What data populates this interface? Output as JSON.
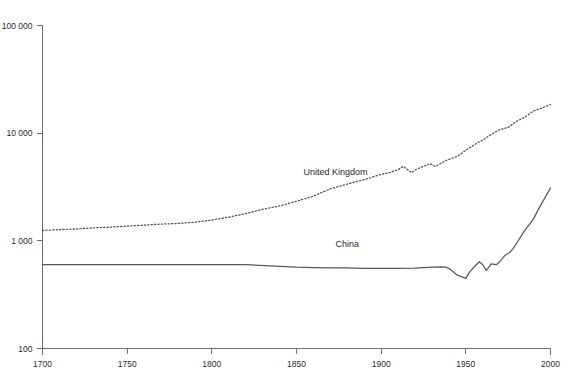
{
  "chart_data": {
    "type": "line",
    "title": "",
    "subtitle": "",
    "xlabel": "",
    "ylabel": "",
    "yscale": "log",
    "xlim": [
      1700,
      2000
    ],
    "ylim": [
      100,
      100000
    ],
    "grid": false,
    "legend_position": "inline-labels",
    "x_ticks": [
      1700,
      1750,
      1800,
      1850,
      1900,
      1950,
      2000
    ],
    "x_tick_labels": [
      "1700",
      "1750",
      "1800",
      "1850",
      "1900",
      "1950",
      "2000"
    ],
    "y_ticks": [
      100,
      1000,
      10000,
      100000
    ],
    "y_tick_labels": [
      "100",
      "1 000",
      "10 000",
      "100 000"
    ],
    "series": [
      {
        "name": "United Kingdom",
        "style": "dotted",
        "color": "#4f4f4f",
        "label_x": 1873,
        "label_y": 4050,
        "x": [
          1700,
          1710,
          1720,
          1730,
          1740,
          1750,
          1760,
          1770,
          1780,
          1790,
          1800,
          1810,
          1820,
          1830,
          1840,
          1850,
          1860,
          1870,
          1880,
          1890,
          1900,
          1905,
          1910,
          1913,
          1918,
          1920,
          1925,
          1929,
          1932,
          1938,
          1945,
          1950,
          1955,
          1960,
          1965,
          1970,
          1975,
          1980,
          1985,
          1990,
          1995,
          2000
        ],
        "values": [
          1250,
          1270,
          1290,
          1320,
          1340,
          1370,
          1400,
          1430,
          1450,
          1490,
          1560,
          1660,
          1790,
          1960,
          2110,
          2330,
          2600,
          3040,
          3370,
          3700,
          4150,
          4300,
          4580,
          4920,
          4300,
          4550,
          4930,
          5200,
          4900,
          5550,
          6100,
          6940,
          7800,
          8650,
          9750,
          10800,
          11300,
          12900,
          14100,
          16100,
          17100,
          18500
        ]
      },
      {
        "name": "China",
        "style": "solid",
        "color": "#5a5a5a",
        "label_x": 1880,
        "label_y": 880,
        "x": [
          1700,
          1750,
          1800,
          1820,
          1840,
          1850,
          1860,
          1870,
          1880,
          1890,
          1900,
          1910,
          1920,
          1930,
          1935,
          1938,
          1940,
          1945,
          1950,
          1952,
          1955,
          1958,
          1960,
          1962,
          1965,
          1968,
          1970,
          1973,
          1976,
          1978,
          1980,
          1984,
          1986,
          1990,
          1993,
          1996,
          2000
        ],
        "values": [
          600,
          600,
          600,
          600,
          580,
          570,
          565,
          560,
          560,
          555,
          555,
          555,
          558,
          570,
          572,
          570,
          555,
          480,
          448,
          510,
          575,
          640,
          600,
          530,
          610,
          600,
          640,
          730,
          780,
          850,
          950,
          1200,
          1320,
          1600,
          1980,
          2400,
          3100
        ]
      }
    ]
  }
}
